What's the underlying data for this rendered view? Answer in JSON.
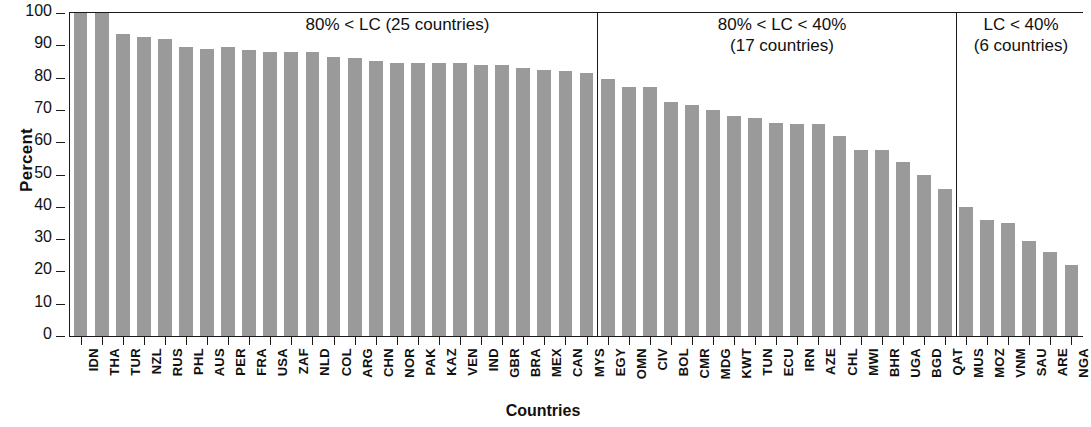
{
  "chart_data": {
    "type": "bar",
    "title": "",
    "xlabel": "Countries",
    "ylabel": "Percent",
    "ylim": [
      0,
      100
    ],
    "yticks": [
      0,
      10,
      20,
      30,
      40,
      50,
      60,
      70,
      80,
      90,
      100
    ],
    "grid": false,
    "legend": "none",
    "bar_color": "#9a9a9a",
    "axis_color": "#1a1a1a",
    "categories": [
      "IDN",
      "THA",
      "TUR",
      "NZL",
      "RUS",
      "PHL",
      "AUS",
      "PER",
      "FRA",
      "USA",
      "ZAF",
      "NLD",
      "COL",
      "ARG",
      "CHN",
      "NOR",
      "PAK",
      "KAZ",
      "VEN",
      "IND",
      "GBR",
      "BRA",
      "MEX",
      "CAN",
      "MYS",
      "EGY",
      "OMN",
      "CIV",
      "BOL",
      "CMR",
      "MDG",
      "KWT",
      "TUN",
      "ECU",
      "IRN",
      "AZE",
      "CHL",
      "MWI",
      "BHR",
      "UGA",
      "BGD",
      "QAT",
      "MUS",
      "MOZ",
      "VNM",
      "SAU",
      "ARE",
      "NGA"
    ],
    "values": [
      100,
      100,
      93.5,
      92.5,
      92,
      89.5,
      89,
      89.5,
      88.5,
      88,
      88,
      88,
      86.5,
      86,
      85,
      84.5,
      84.5,
      84.5,
      84.5,
      84,
      84,
      83,
      82.5,
      82,
      81.5,
      79.5,
      77,
      77,
      72.5,
      71.5,
      70,
      68,
      67.5,
      66,
      65.5,
      65.5,
      62,
      57.5,
      57.5,
      54,
      50,
      45.5,
      40,
      36,
      35,
      29.5,
      26,
      22
    ],
    "annotations": [
      {
        "id": "panel-1",
        "text_line_1": "80% < LC (25 countries)",
        "text_line_2": "",
        "group_count": 25
      },
      {
        "id": "panel-2",
        "text_line_1": "80% < LC < 40%",
        "text_line_2": "(17 countries)",
        "group_count": 17
      },
      {
        "id": "panel-3",
        "text_line_1": "LC < 40%",
        "text_line_2": "(6 countries)",
        "group_count": 6
      }
    ],
    "dividers_after_index": [
      24,
      41
    ]
  }
}
